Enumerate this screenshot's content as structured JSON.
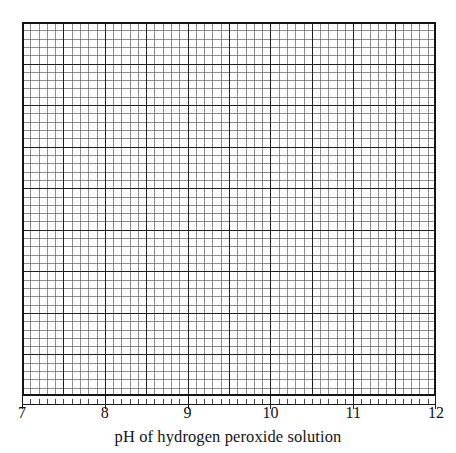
{
  "figure": {
    "kind": "graph-paper",
    "background_color": "#ffffff"
  },
  "axis": {
    "title": "pH of hydrogen peroxide solution",
    "tick_labels": [
      "7",
      "8",
      "9",
      "10",
      "11",
      "12"
    ],
    "line_color": "#1a1a1a"
  },
  "grid": {
    "minor_color": "#6f6f6f",
    "major_color": "#1f1f1f",
    "border_color": "#141414"
  },
  "chart_data": {
    "type": "line",
    "title": "",
    "subtitle": "",
    "xlabel": "pH of hydrogen peroxide solution",
    "ylabel": "",
    "xlim": [
      7,
      12
    ],
    "ylim": [
      0,
      4.5
    ],
    "xticks": [
      7,
      8,
      9,
      10,
      11,
      12
    ],
    "xticklabels": [
      "7",
      "8",
      "9",
      "10",
      "11",
      "12"
    ],
    "yticks": [],
    "yticklabels": [],
    "grid": true,
    "grid_minor": true,
    "grid_major_every": 5,
    "columns_minor": 50,
    "rows_minor": 45,
    "minor_step_x": 0.1,
    "legend": null,
    "annotations": [],
    "series": [],
    "note": "Blank graph paper grid for plotting; no data series are drawn."
  }
}
